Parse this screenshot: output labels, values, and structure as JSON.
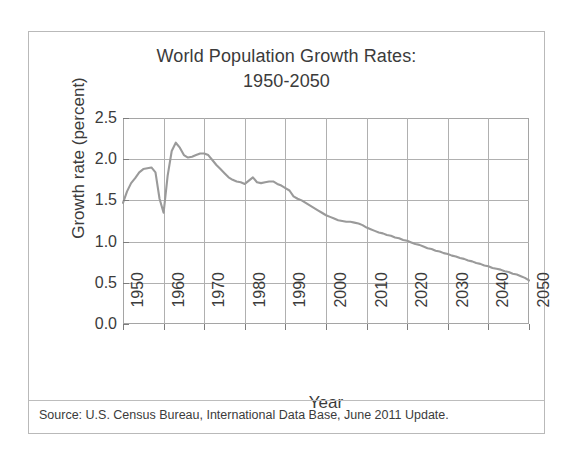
{
  "figure": {
    "title_line1": "World Population Growth Rates:",
    "title_line2": "1950-2050",
    "source_note": "Source: U.S. Census Bureau, International Data Base, June 2011 Update.",
    "line_color": "#9a9a9a",
    "grid_color": "#b0b0b0",
    "text_color": "#3b3b3b"
  },
  "chart_data": {
    "type": "line",
    "title": "World Population Growth Rates: 1950-2050",
    "xlabel": "Year",
    "ylabel": "Growth rate (percent)",
    "xlim": [
      1950,
      2050
    ],
    "ylim": [
      0.0,
      2.5
    ],
    "xticks": [
      1950,
      1960,
      1970,
      1980,
      1990,
      2000,
      2010,
      2020,
      2030,
      2040,
      2050
    ],
    "xtick_labels": [
      "1950",
      "1960",
      "1970",
      "1980",
      "1990",
      "2000",
      "2010",
      "2020",
      "2030",
      "2040",
      "2050"
    ],
    "yticks": [
      0.0,
      0.5,
      1.0,
      1.5,
      2.0,
      2.5
    ],
    "ytick_labels": [
      "0.0",
      "0.5",
      "1.0",
      "1.5",
      "2.0",
      "2.5"
    ],
    "grid": true,
    "legend": "none",
    "series": [
      {
        "name": "World population growth rate",
        "x": [
          1950,
          1951,
          1952,
          1953,
          1954,
          1955,
          1956,
          1957,
          1958,
          1959,
          1960,
          1961,
          1962,
          1963,
          1964,
          1965,
          1966,
          1967,
          1968,
          1969,
          1970,
          1971,
          1972,
          1973,
          1974,
          1975,
          1976,
          1977,
          1978,
          1979,
          1980,
          1981,
          1982,
          1983,
          1984,
          1985,
          1986,
          1987,
          1988,
          1989,
          1990,
          1991,
          1992,
          1993,
          1994,
          1995,
          1996,
          1997,
          1998,
          1999,
          2000,
          2001,
          2002,
          2003,
          2004,
          2005,
          2006,
          2007,
          2008,
          2009,
          2010,
          2011,
          2012,
          2013,
          2014,
          2015,
          2016,
          2017,
          2018,
          2019,
          2020,
          2021,
          2022,
          2023,
          2024,
          2025,
          2026,
          2027,
          2028,
          2029,
          2030,
          2031,
          2032,
          2033,
          2034,
          2035,
          2036,
          2037,
          2038,
          2039,
          2040,
          2041,
          2042,
          2043,
          2044,
          2045,
          2046,
          2047,
          2048,
          2049,
          2050
        ],
        "y": [
          1.47,
          1.61,
          1.71,
          1.77,
          1.84,
          1.88,
          1.89,
          1.9,
          1.84,
          1.52,
          1.35,
          1.8,
          2.1,
          2.2,
          2.14,
          2.05,
          2.02,
          2.03,
          2.05,
          2.07,
          2.07,
          2.05,
          1.99,
          1.93,
          1.88,
          1.83,
          1.78,
          1.75,
          1.73,
          1.72,
          1.7,
          1.74,
          1.78,
          1.72,
          1.71,
          1.72,
          1.73,
          1.73,
          1.7,
          1.68,
          1.65,
          1.62,
          1.55,
          1.52,
          1.5,
          1.47,
          1.44,
          1.41,
          1.38,
          1.35,
          1.32,
          1.3,
          1.28,
          1.26,
          1.25,
          1.24,
          1.24,
          1.23,
          1.22,
          1.2,
          1.17,
          1.15,
          1.13,
          1.11,
          1.1,
          1.08,
          1.07,
          1.05,
          1.04,
          1.02,
          1.01,
          0.99,
          0.97,
          0.96,
          0.94,
          0.92,
          0.91,
          0.89,
          0.88,
          0.86,
          0.85,
          0.83,
          0.82,
          0.8,
          0.79,
          0.77,
          0.76,
          0.74,
          0.73,
          0.71,
          0.7,
          0.68,
          0.67,
          0.66,
          0.64,
          0.63,
          0.61,
          0.6,
          0.58,
          0.56,
          0.53
        ]
      }
    ]
  }
}
